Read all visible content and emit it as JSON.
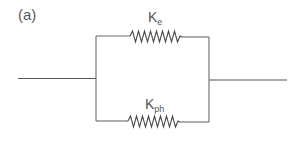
{
  "figure": {
    "panel_label": "(a)",
    "components": [
      {
        "type": "spring",
        "position": "top-branch",
        "symbol": "K",
        "subscript": "e"
      },
      {
        "type": "spring",
        "position": "bottom-branch",
        "symbol": "K",
        "subscript": "ph"
      }
    ],
    "connection": "parallel",
    "colors": {
      "line": "#6a6a6a",
      "text": "#555555",
      "background": "#ffffff"
    }
  }
}
